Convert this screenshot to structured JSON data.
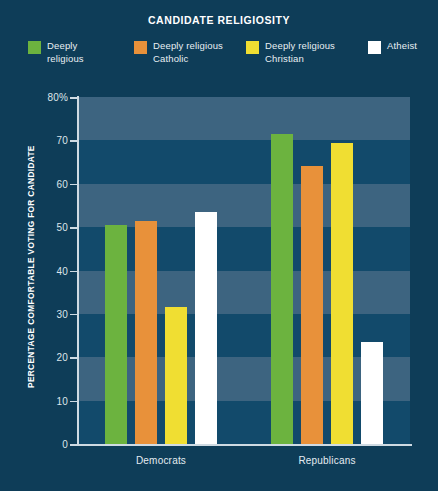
{
  "chart_data": {
    "type": "bar",
    "title": "CANDIDATE RELIGIOSITY",
    "xlabel": "",
    "ylabel": "PERCENTAGE COMFORTABLE VOTING FOR CANDIDATE",
    "categories": [
      "Democrats",
      "Republicans"
    ],
    "series": [
      {
        "name": "Deeply religious",
        "color": "#6cb33f",
        "values": [
          50.5,
          71.5
        ]
      },
      {
        "name": "Deeply religious Catholic",
        "color": "#e8913a",
        "values": [
          51.5,
          64.0
        ]
      },
      {
        "name": "Deeply religious Christian",
        "color": "#f0de32",
        "values": [
          31.5,
          69.5
        ]
      },
      {
        "name": "Atheist",
        "color": "#ffffff",
        "values": [
          53.5,
          23.5
        ]
      }
    ],
    "ylim": [
      0,
      80
    ],
    "y_ticks": [
      0,
      10,
      20,
      30,
      40,
      50,
      60,
      70,
      80
    ],
    "y_tick_labels": [
      "0",
      "10",
      "20",
      "30",
      "40",
      "50",
      "60",
      "70",
      "80%"
    ],
    "grid": "horizontal-bands",
    "legend_position": "top",
    "background_color": "#0e3d58",
    "band_light_color": "#3d6480",
    "band_dark_color": "#124a6b",
    "axis_color": "#cfdbe3"
  },
  "legend": {
    "items": [
      {
        "label": "Deeply\nreligious",
        "color": "#6cb33f"
      },
      {
        "label": "Deeply religious\nCatholic",
        "color": "#e8913a"
      },
      {
        "label": "Deeply religious\nChristian",
        "color": "#f0de32"
      },
      {
        "label": "Atheist",
        "color": "#ffffff"
      }
    ]
  }
}
